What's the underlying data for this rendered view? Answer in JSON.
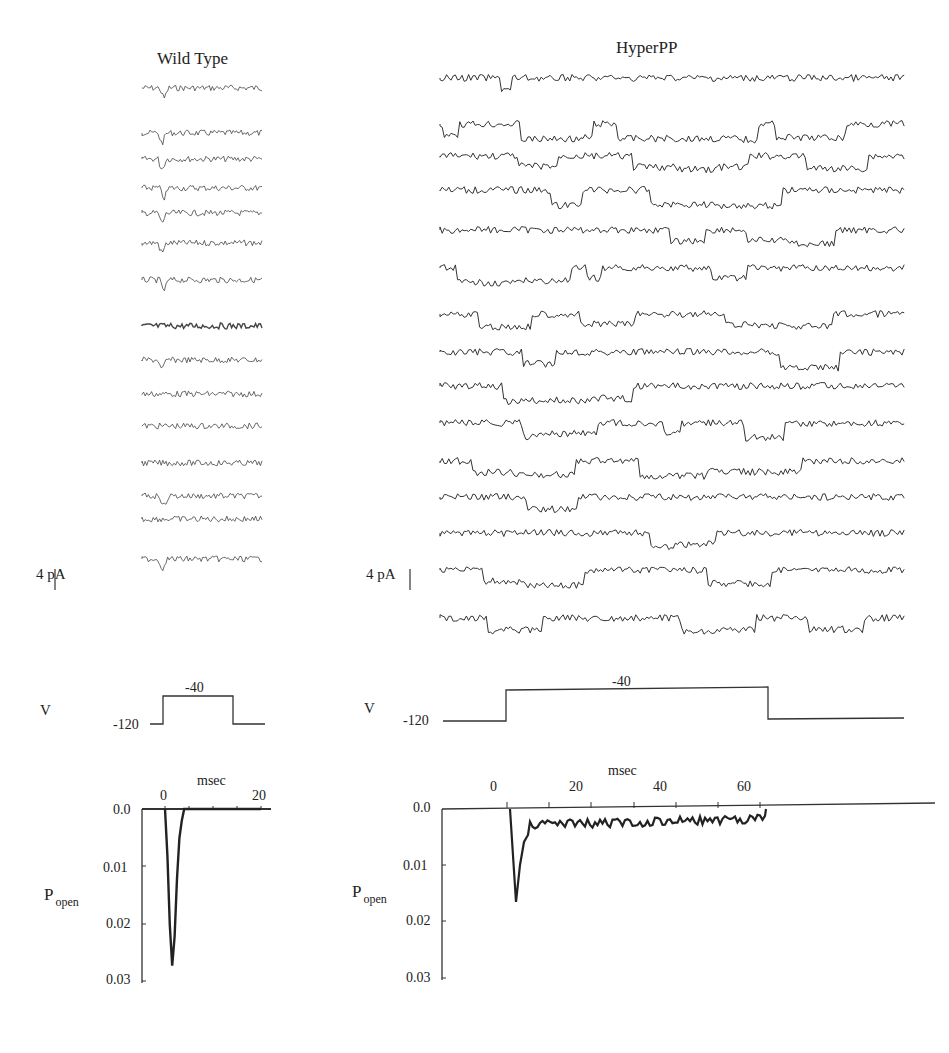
{
  "panels": {
    "wild_type": {
      "title": "Wild Type",
      "scale_bar_label": "4 pA",
      "voltage": {
        "label": "V",
        "holding": "-120",
        "step": "-40"
      },
      "popen_chart": {
        "xlabel": "msec",
        "ylabel": "P",
        "ylabel_sub": "open",
        "xticks": [
          "0",
          "20"
        ],
        "yticks": [
          "0.0",
          "0.01",
          "0.02",
          "0.03"
        ]
      }
    },
    "hyperpp": {
      "title": "HyperPP",
      "scale_bar_label": "4 pA",
      "voltage": {
        "label": "V",
        "holding": "-120",
        "step": "-40"
      },
      "popen_chart": {
        "xlabel": "msec",
        "ylabel": "P",
        "ylabel_sub": "open",
        "xticks": [
          "0",
          "20",
          "40",
          "60"
        ],
        "yticks": [
          "0.0",
          "0.01",
          "0.02",
          "0.03"
        ]
      }
    }
  },
  "chart_data": [
    {
      "type": "line",
      "title": "Wild Type",
      "xlabel": "msec",
      "ylabel": "P_open",
      "xlim": [
        -1,
        21
      ],
      "ylim": [
        0.03,
        0.0
      ],
      "x": [
        0,
        0.5,
        1,
        1.5,
        2,
        2.5,
        3,
        3.5,
        4,
        5,
        10,
        20
      ],
      "values": [
        0.0,
        0.008,
        0.02,
        0.027,
        0.022,
        0.012,
        0.005,
        0.002,
        0.0,
        0.0,
        0.0,
        0.0
      ],
      "grid": false,
      "traces_count": 15
    },
    {
      "type": "line",
      "title": "HyperPP",
      "xlabel": "msec",
      "ylabel": "P_open",
      "xlim": [
        -12,
        85
      ],
      "ylim": [
        0.03,
        0.0
      ],
      "x": [
        0,
        1,
        2,
        3,
        4,
        5,
        10,
        15,
        20,
        25,
        30,
        35,
        40,
        45,
        50,
        55,
        60
      ],
      "values": [
        0.0,
        0.015,
        0.028,
        0.01,
        0.006,
        0.004,
        0.003,
        0.002,
        0.003,
        0.003,
        0.004,
        0.004,
        0.001,
        0.003,
        0.002,
        0.002,
        0.002
      ],
      "grid": false,
      "traces_count": 15
    }
  ]
}
